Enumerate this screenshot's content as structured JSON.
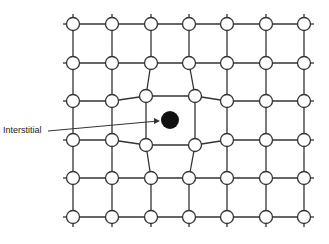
{
  "diagram": {
    "label": "Interstitial",
    "columns_x": [
      73,
      112,
      151,
      189,
      227,
      266,
      304
    ],
    "rows_y": [
      24,
      63,
      101,
      140,
      178,
      217
    ],
    "displaced_atoms": [
      {
        "row": 2,
        "col": 2,
        "x": 146,
        "y": 96
      },
      {
        "row": 2,
        "col": 3,
        "x": 195,
        "y": 96
      },
      {
        "row": 3,
        "col": 2,
        "x": 146,
        "y": 145
      },
      {
        "row": 3,
        "col": 3,
        "x": 195,
        "y": 145
      }
    ],
    "interstitial_atom": {
      "x": 170,
      "y": 120,
      "r": 9
    },
    "atom_radius": 6.5,
    "colors": {
      "line": "#333333",
      "atom_fill": "#ffffff",
      "interstitial": "#111111"
    }
  }
}
